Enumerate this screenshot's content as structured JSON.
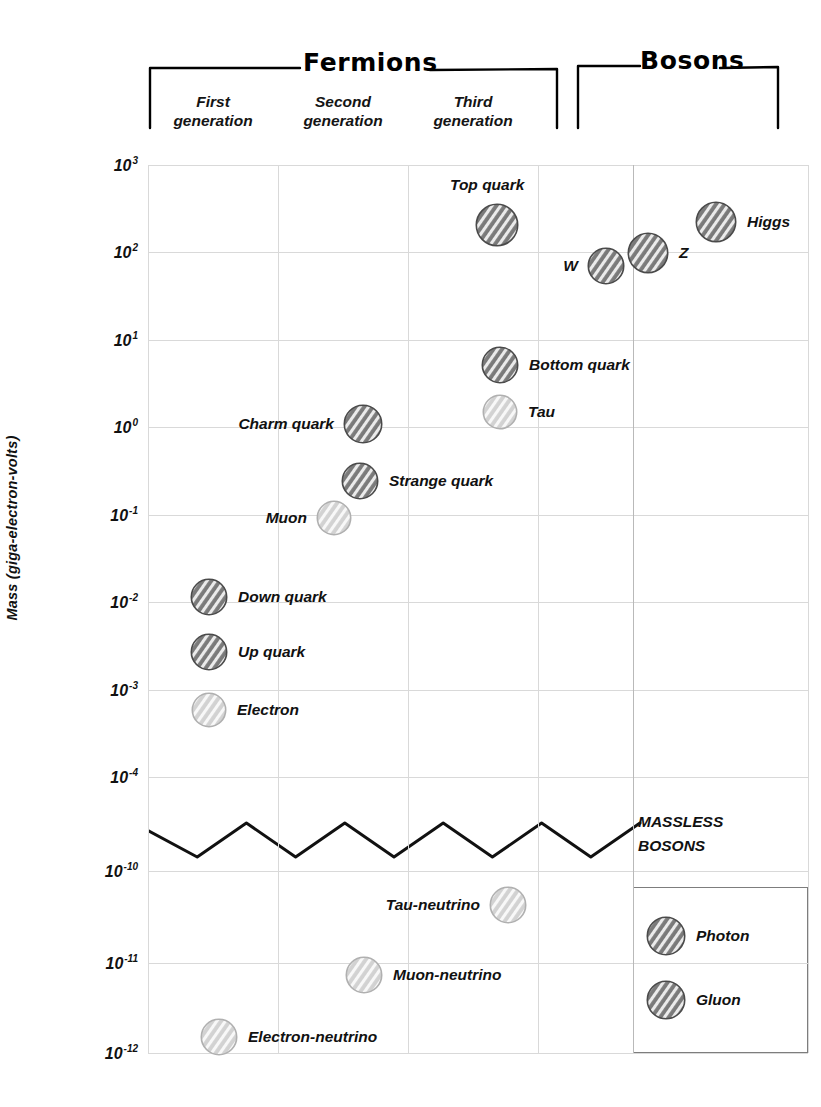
{
  "chart_data": {
    "type": "scatter",
    "title": "",
    "ylabel": "Mass (giga-electron-volts)",
    "xlabel": "",
    "grid": true,
    "axis_break": true,
    "yticks": [
      {
        "mantissa": "10",
        "exp": "3"
      },
      {
        "mantissa": "10",
        "exp": "2"
      },
      {
        "mantissa": "10",
        "exp": "1"
      },
      {
        "mantissa": "10",
        "exp": "0"
      },
      {
        "mantissa": "10",
        "exp": "-1"
      },
      {
        "mantissa": "10",
        "exp": "-2"
      },
      {
        "mantissa": "10",
        "exp": "-3"
      },
      {
        "mantissa": "10",
        "exp": "-4"
      },
      {
        "mantissa": "10",
        "exp": "-10"
      },
      {
        "mantissa": "10",
        "exp": "-11"
      },
      {
        "mantissa": "10",
        "exp": "-12"
      }
    ],
    "groups": [
      {
        "name": "Fermions"
      },
      {
        "name": "Bosons"
      }
    ],
    "columns": [
      {
        "label": "First\ngeneration"
      },
      {
        "label": "Second\ngeneration"
      },
      {
        "label": "Third\ngeneration"
      }
    ],
    "annotation": "MASSLESS\nBOSONS",
    "points": [
      {
        "name": "Top quark",
        "label": "Top quark",
        "category": "quark",
        "column": "third",
        "mass_gev": 173,
        "exp": 2.24,
        "side": "above"
      },
      {
        "name": "Higgs",
        "label": "Higgs",
        "category": "boson",
        "column": "bosons",
        "mass_gev": 125,
        "exp": 2.1,
        "side": "right"
      },
      {
        "name": "Z",
        "label": "Z",
        "category": "boson",
        "column": "bosons",
        "mass_gev": 91.2,
        "exp": 1.96,
        "side": "right"
      },
      {
        "name": "W",
        "label": "W",
        "category": "boson",
        "column": "bosons",
        "mass_gev": 80.4,
        "exp": 1.91,
        "side": "left"
      },
      {
        "name": "Bottom quark",
        "label": "Bottom quark",
        "category": "quark",
        "column": "third",
        "mass_gev": 4.18,
        "exp": 0.62,
        "side": "right"
      },
      {
        "name": "Tau",
        "label": "Tau",
        "category": "lepton",
        "column": "third",
        "mass_gev": 1.777,
        "exp": 0.25,
        "side": "right"
      },
      {
        "name": "Charm quark",
        "label": "Charm quark",
        "category": "quark",
        "column": "second",
        "mass_gev": 1.27,
        "exp": 0.1,
        "side": "left"
      },
      {
        "name": "Strange quark",
        "label": "Strange quark",
        "category": "quark",
        "column": "second",
        "mass_gev": 0.093,
        "exp": -0.33,
        "side": "right"
      },
      {
        "name": "Muon",
        "label": "Muon",
        "category": "lepton",
        "column": "second",
        "mass_gev": 0.1057,
        "exp": -0.98,
        "side": "left"
      },
      {
        "name": "Down quark",
        "label": "Down quark",
        "category": "quark",
        "column": "first",
        "mass_gev": 0.0047,
        "exp": -2.0,
        "side": "right"
      },
      {
        "name": "Up quark",
        "label": "Up quark",
        "category": "quark",
        "column": "first",
        "mass_gev": 0.0022,
        "exp": -2.38,
        "side": "right"
      },
      {
        "name": "Electron",
        "label": "Electron",
        "category": "lepton",
        "column": "first",
        "mass_gev": 0.000511,
        "exp": -2.75,
        "side": "right"
      },
      {
        "name": "Tau-neutrino",
        "label": "Tau-neutrino",
        "category": "neutrino",
        "column": "third",
        "mass_gev": 1e-10,
        "exp": -10.2,
        "side": "left"
      },
      {
        "name": "Muon-neutrino",
        "label": "Muon-neutrino",
        "category": "neutrino",
        "column": "second",
        "mass_gev": 1e-11,
        "exp": -11.1,
        "side": "right"
      },
      {
        "name": "Electron-neutrino",
        "label": "Electron-neutrino",
        "category": "neutrino",
        "column": "first",
        "mass_gev": 1e-12,
        "exp": -12.0,
        "side": "right"
      },
      {
        "name": "Photon",
        "label": "Photon",
        "category": "boson",
        "column": "bosons",
        "mass_gev": 0,
        "exp": null,
        "side": "right"
      },
      {
        "name": "Gluon",
        "label": "Gluon",
        "category": "boson",
        "column": "bosons",
        "mass_gev": 0,
        "exp": null,
        "side": "right"
      }
    ],
    "colors": {
      "quark_dark": "#6f6f6f",
      "lepton_light": "#c2c2c2",
      "boson_dark": "#6f6f6f",
      "neutrino_light": "#cccccc",
      "gridline": "#d9d9d9",
      "text": "#111111",
      "break_line": "#111111",
      "box_border": "#7d7d7d"
    }
  }
}
